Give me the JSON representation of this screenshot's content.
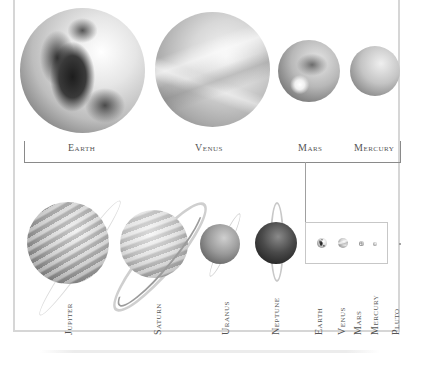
{
  "diagram": {
    "top_row": {
      "planets": [
        {
          "name": "Earth",
          "label": "Earth"
        },
        {
          "name": "Venus",
          "label": "Venus"
        },
        {
          "name": "Mars",
          "label": "Mars"
        },
        {
          "name": "Mercury",
          "label": "Mercury"
        }
      ]
    },
    "bottom_row": {
      "planets": [
        {
          "name": "Jupiter",
          "label": "Jupiter"
        },
        {
          "name": "Saturn",
          "label": "Saturn"
        },
        {
          "name": "Uranus",
          "label": "Uranus"
        },
        {
          "name": "Neptune",
          "label": "Neptune"
        }
      ]
    },
    "scale_inset": {
      "planets": [
        {
          "name": "Earth",
          "label": "Earth"
        },
        {
          "name": "Venus",
          "label": "Venus"
        },
        {
          "name": "Mars",
          "label": "Mars"
        },
        {
          "name": "Mercury",
          "label": "Mercury"
        },
        {
          "name": "Pluto",
          "label": "Pluto"
        }
      ]
    },
    "colors": {
      "frame": "#d6d6d6",
      "bracket_line": "#8a8a8a",
      "label_text": "#555555"
    }
  }
}
